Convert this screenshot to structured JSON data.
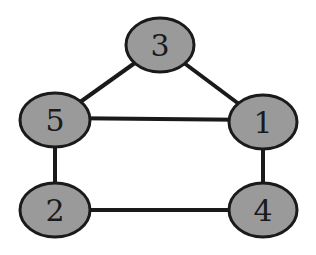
{
  "graph": {
    "nodes": [
      {
        "id": "3",
        "label": "3",
        "x": 160,
        "y": 45
      },
      {
        "id": "5",
        "label": "5",
        "x": 55,
        "y": 120
      },
      {
        "id": "1",
        "label": "1",
        "x": 263,
        "y": 122
      },
      {
        "id": "2",
        "label": "2",
        "x": 55,
        "y": 210
      },
      {
        "id": "4",
        "label": "4",
        "x": 263,
        "y": 210
      }
    ],
    "edges": [
      {
        "from": "3",
        "to": "5"
      },
      {
        "from": "3",
        "to": "1"
      },
      {
        "from": "5",
        "to": "1"
      },
      {
        "from": "5",
        "to": "2"
      },
      {
        "from": "1",
        "to": "4"
      },
      {
        "from": "2",
        "to": "4"
      }
    ],
    "colors": {
      "node_fill": "#9a9a9a",
      "stroke": "#1a1a1a",
      "background": "#ffffff"
    }
  }
}
